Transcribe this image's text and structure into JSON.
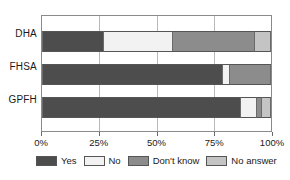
{
  "chart_data": {
    "type": "bar",
    "orientation": "horizontal",
    "stacked": true,
    "normalized": true,
    "title": "",
    "subtitle": "",
    "xlabel": "",
    "ylabel": "",
    "xlim": [
      0,
      100
    ],
    "xticks": [
      0,
      25,
      50,
      75,
      100
    ],
    "xticklabels": [
      "0%",
      "25%",
      "50%",
      "75%",
      "100%"
    ],
    "grid": true,
    "grid_axis": "x",
    "legend_position": "bottom",
    "categories": [
      "DHA",
      "FHSA",
      "GPFH"
    ],
    "series": [
      {
        "name": "Yes",
        "color": "#4d4d4d",
        "values": [
          27,
          79,
          87
        ]
      },
      {
        "name": "No",
        "color": "#f2f2f2",
        "values": [
          30,
          3,
          7
        ]
      },
      {
        "name": "Don't know",
        "color": "#8c8c8c",
        "values": [
          36,
          18,
          2
        ]
      },
      {
        "name": "No answer",
        "color": "#c4c4c4",
        "values": [
          7,
          0,
          4
        ]
      }
    ]
  },
  "colors": {
    "yes": "#4d4d4d",
    "no": "#f2f2f2",
    "dont_know": "#8c8c8c",
    "no_answer": "#c4c4c4",
    "axis": "#8a8a8a",
    "gridline": "#b9b9b9",
    "text": "#1a1a1a",
    "background": "#ffffff"
  }
}
